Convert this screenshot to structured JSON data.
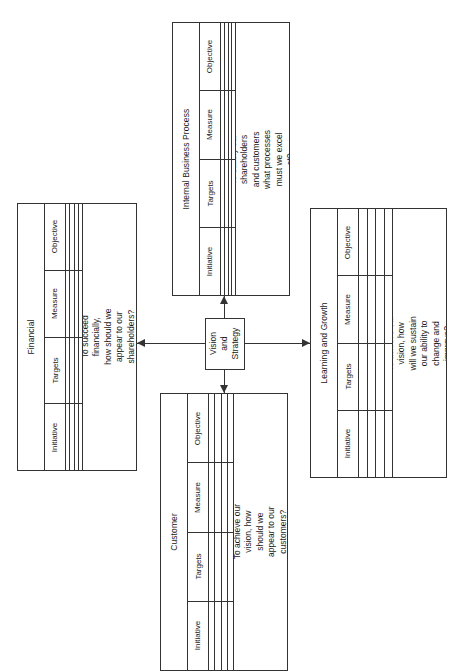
{
  "diagram": {
    "center": {
      "label": "Vision\nand\nStrategy",
      "line1": "Vision",
      "line2": "and",
      "line3": "Strategy"
    },
    "table_headers": [
      "Objective",
      "Measure",
      "Targets",
      "Initiative"
    ],
    "row_count": 4,
    "perspectives": [
      {
        "id": "financial",
        "title": "Financial",
        "question_lines": [
          "To succeed",
          "financially,",
          "how should we",
          "appear to our",
          "shareholders?"
        ],
        "headers": [
          "Objective",
          "Measure",
          "Targets",
          "Initiative"
        ]
      },
      {
        "id": "internal-business-process",
        "title": "Internal Business Process",
        "question_lines": [
          "To satisfy our",
          "shareholders",
          "and customers",
          "what processes",
          "must we excel",
          "at?"
        ],
        "headers": [
          "Objective",
          "Measure",
          "Targets",
          "Initiative"
        ]
      },
      {
        "id": "customer",
        "title": "Customer",
        "question_lines": [
          "To achieve our",
          "vision, how",
          "should we",
          "appear to our",
          "customers?"
        ],
        "headers": [
          "Objective",
          "Measure",
          "Targets",
          "Initiative"
        ]
      },
      {
        "id": "learning-and-growth",
        "title": "Learning and Growth",
        "question_lines": [
          "To achieve our",
          "vision, how",
          "will we sustain",
          "our ability to",
          "change and",
          "improve?"
        ],
        "headers": [
          "Objective",
          "Measure",
          "Targets",
          "Initiative"
        ]
      }
    ],
    "connectors": [
      {
        "id": "center-to-financial",
        "direction": "left"
      },
      {
        "id": "center-to-internal-business-process",
        "direction": "up"
      },
      {
        "id": "center-to-customer",
        "direction": "down"
      },
      {
        "id": "center-to-learning-and-growth",
        "direction": "right"
      }
    ],
    "colors": {
      "line": "#333333",
      "background": "#ffffff",
      "text": "#1a1a1a"
    }
  }
}
